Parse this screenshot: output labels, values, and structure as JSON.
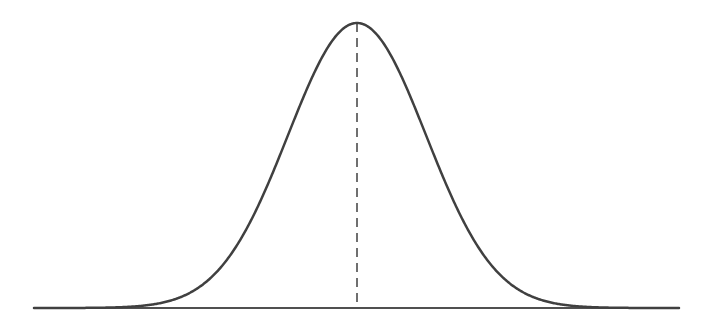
{
  "chart_data": {
    "type": "line",
    "title": "",
    "xlabel": "",
    "ylabel": "",
    "distribution": {
      "name": "normal",
      "mean": 0,
      "std": 1
    },
    "xlim": [
      -4.65,
      4.7
    ],
    "ylim": [
      0,
      0.3989
    ],
    "series": [
      {
        "name": "pdf",
        "x": [
          -4.5,
          -4.0,
          -3.5,
          -3.0,
          -2.5,
          -2.0,
          -1.5,
          -1.0,
          -0.5,
          0.0,
          0.5,
          1.0,
          1.5,
          2.0,
          2.5,
          3.0,
          3.5,
          4.0,
          4.5
        ],
        "values": [
          0.0,
          0.0001,
          0.0009,
          0.0044,
          0.0175,
          0.054,
          0.1295,
          0.242,
          0.3521,
          0.3989,
          0.3521,
          0.242,
          0.1295,
          0.054,
          0.0175,
          0.0044,
          0.0009,
          0.0001,
          0.0
        ]
      }
    ],
    "annotations": [
      {
        "type": "vline",
        "x": 0,
        "style": "dashed",
        "label": "mean"
      }
    ],
    "grid": false,
    "legend": false,
    "colors": {
      "curve": "#404040",
      "baseline": "#505050",
      "mean_line": "#404040"
    }
  },
  "layout": {
    "baseline_y": 308,
    "peak_y": 23,
    "center_x": 357,
    "sigma_px": 69,
    "x_start": 34,
    "x_end": 679
  }
}
